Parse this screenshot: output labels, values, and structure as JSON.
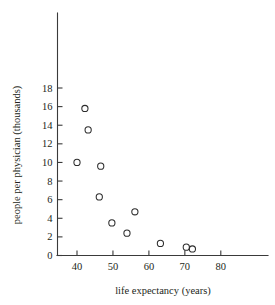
{
  "chart_data": {
    "type": "scatter",
    "title": "",
    "xlabel": "life expectancy (years)",
    "ylabel": "people per physician (thousands)",
    "xlim": [
      36,
      90
    ],
    "ylim": [
      0,
      19.8
    ],
    "xticks": [
      40,
      50,
      60,
      70,
      80
    ],
    "yticks": [
      0,
      2,
      4,
      6,
      8,
      10,
      12,
      14,
      16,
      18
    ],
    "xtick_labels": [
      "40",
      "50",
      "60",
      "70",
      "80"
    ],
    "ytick_labels": [
      "0",
      "2",
      "4",
      "6",
      "8",
      "10",
      "12",
      "14",
      "16",
      "18"
    ],
    "grid": false,
    "legend": false,
    "marker": "open-circle",
    "marker_color": "#2b2b2b",
    "points": [
      {
        "x": 40.0,
        "y": 10.0
      },
      {
        "x": 42.2,
        "y": 15.8
      },
      {
        "x": 43.1,
        "y": 13.5
      },
      {
        "x": 46.2,
        "y": 6.3
      },
      {
        "x": 46.6,
        "y": 9.6
      },
      {
        "x": 49.7,
        "y": 3.5
      },
      {
        "x": 53.9,
        "y": 2.4
      },
      {
        "x": 56.1,
        "y": 4.7
      },
      {
        "x": 63.2,
        "y": 1.3
      },
      {
        "x": 70.4,
        "y": 0.9
      },
      {
        "x": 72.1,
        "y": 0.7
      }
    ]
  }
}
